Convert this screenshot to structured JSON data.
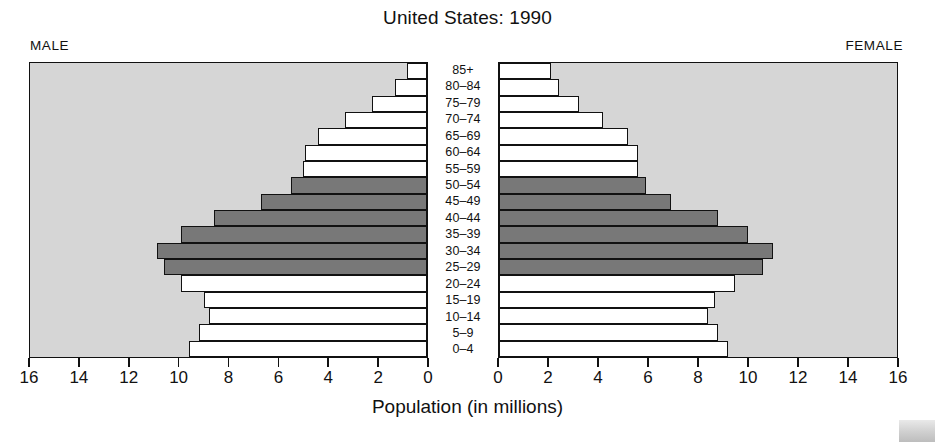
{
  "chart_title": "United States: 1990",
  "side_labels": {
    "left": "MALE",
    "right": "FEMALE"
  },
  "xaxis_title": "Population (in millions)",
  "colors": {
    "panel_background": "#d6d6d6",
    "bar_white": "#ffffff",
    "bar_highlight": "#787878",
    "outline": "#111111",
    "page_background": "#ffffff"
  },
  "chart_data": {
    "type": "bar",
    "subtype": "population-pyramid",
    "title": "United States: 1990",
    "xlabel": "Population (in millions)",
    "ylabel": "",
    "categories": [
      "85+",
      "80–84",
      "75–79",
      "70–74",
      "65–69",
      "60–64",
      "55–59",
      "50–54",
      "45–49",
      "40–44",
      "35–39",
      "30–34",
      "25–29",
      "20–24",
      "15–19",
      "10–14",
      "5–9",
      "0–4"
    ],
    "series": [
      {
        "name": "MALE",
        "values": [
          0.8,
          1.3,
          2.2,
          3.3,
          4.4,
          4.9,
          5.0,
          5.5,
          6.7,
          8.6,
          9.9,
          10.9,
          10.6,
          9.9,
          9.0,
          8.8,
          9.2,
          9.6
        ]
      },
      {
        "name": "FEMALE",
        "values": [
          2.1,
          2.4,
          3.2,
          4.2,
          5.2,
          5.6,
          5.6,
          5.9,
          6.9,
          8.8,
          10.0,
          11.0,
          10.6,
          9.5,
          8.7,
          8.4,
          8.8,
          9.2
        ]
      }
    ],
    "highlighted_categories": [
      "50–54",
      "45–49",
      "40–44",
      "35–39",
      "30–34",
      "25–29"
    ],
    "xlim_left": [
      16,
      0
    ],
    "xlim_right": [
      0,
      16
    ],
    "xticks": [
      0,
      2,
      4,
      6,
      8,
      10,
      12,
      14,
      16
    ],
    "xticklabels_left": [
      "16",
      "14",
      "12",
      "10",
      "8",
      "6",
      "4",
      "2",
      "0"
    ],
    "xticklabels_right": [
      "0",
      "2",
      "4",
      "6",
      "8",
      "10",
      "12",
      "14",
      "16"
    ],
    "grid": false,
    "legend": false,
    "units": "millions"
  }
}
